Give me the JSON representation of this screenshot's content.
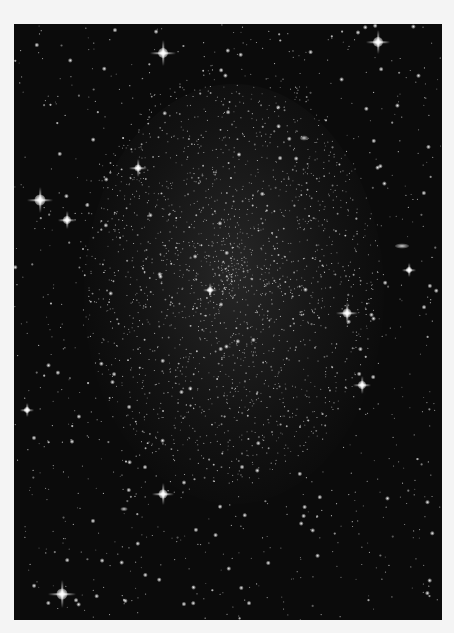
{
  "image": {
    "subject": "dwarf galaxy starfield",
    "description": "Grayscale astronomical photograph of a diffuse dwarf galaxy composed of many faint stars, with scattered bright foreground stars showing diffraction spikes",
    "colors": {
      "background": "#0b0b0b",
      "border": "#f4f4f4",
      "star": "#ffffff"
    }
  },
  "bright_stars": [
    {
      "x": 149,
      "y": 29,
      "size": 10,
      "spike": 26
    },
    {
      "x": 364,
      "y": 18,
      "size": 10,
      "spike": 24
    },
    {
      "x": 124,
      "y": 144,
      "size": 7,
      "spike": 18
    },
    {
      "x": 26,
      "y": 176,
      "size": 11,
      "spike": 26
    },
    {
      "x": 53,
      "y": 196,
      "size": 8,
      "spike": 18
    },
    {
      "x": 196,
      "y": 266,
      "size": 6,
      "spike": 14
    },
    {
      "x": 333,
      "y": 289,
      "size": 9,
      "spike": 22
    },
    {
      "x": 348,
      "y": 361,
      "size": 8,
      "spike": 18
    },
    {
      "x": 149,
      "y": 470,
      "size": 9,
      "spike": 22
    },
    {
      "x": 48,
      "y": 570,
      "size": 11,
      "spike": 28
    },
    {
      "x": 13,
      "y": 386,
      "size": 6,
      "spike": 14
    },
    {
      "x": 395,
      "y": 246,
      "size": 6,
      "spike": 14
    }
  ],
  "galaxies": [
    {
      "x": 388,
      "y": 222,
      "w": 14,
      "h": 5
    },
    {
      "x": 290,
      "y": 114,
      "w": 8,
      "h": 5
    },
    {
      "x": 110,
      "y": 485,
      "w": 7,
      "h": 4
    }
  ]
}
